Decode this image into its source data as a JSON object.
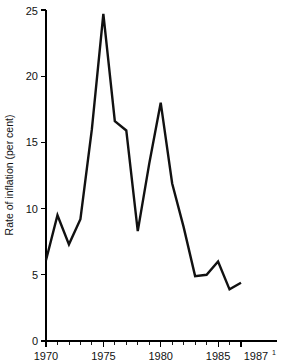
{
  "chart_data": {
    "type": "line",
    "title": "",
    "xlabel": "",
    "ylabel": "Rate of inflation (per cent)",
    "x": [
      1970,
      1971,
      1972,
      1973,
      1974,
      1975,
      1976,
      1977,
      1978,
      1979,
      1980,
      1981,
      1982,
      1983,
      1984,
      1985,
      1986,
      1987
    ],
    "values": [
      6.1,
      9.5,
      7.3,
      9.2,
      16.0,
      24.7,
      16.6,
      15.9,
      8.3,
      13.4,
      18.0,
      11.9,
      8.6,
      4.9,
      5.0,
      6.0,
      3.9,
      4.4
    ],
    "series": [
      {
        "name": "Rate of inflation",
        "values": [
          6.1,
          9.5,
          7.3,
          9.2,
          16.0,
          24.7,
          16.6,
          15.9,
          8.3,
          13.4,
          18.0,
          11.9,
          8.6,
          4.9,
          5.0,
          6.0,
          3.9,
          4.4
        ]
      }
    ],
    "xlim": [
      1970,
      1987
    ],
    "ylim": [
      0,
      25
    ],
    "y_ticks": [
      0,
      5,
      10,
      15,
      20,
      25
    ],
    "y_tick_labels": [
      "0",
      "5",
      "10",
      "15",
      "20",
      "25"
    ],
    "x_tick_labels_major": [
      "1970",
      "1975",
      "1980",
      "1985",
      "1987"
    ],
    "x_tick_values_major": [
      1970,
      1975,
      1980,
      1985,
      1987
    ],
    "x_minor_tick_values": [
      1971,
      1972,
      1973,
      1974,
      1976,
      1977,
      1978,
      1979,
      1981,
      1982,
      1983,
      1984,
      1986
    ],
    "final_label_superscript": "1",
    "grid": false,
    "legend": "none",
    "line_color": "#111111",
    "axis_color": "#000000",
    "background_color": "#ffffff"
  },
  "axes": {
    "y_axis_title": "Rate of inflation (per cent)"
  }
}
